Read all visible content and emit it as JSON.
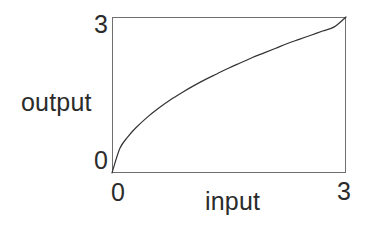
{
  "figure": {
    "name": "input-output-transfer-curve",
    "background_color": "#ffffff",
    "frame_color": "#6f6f6f",
    "curve_color": "#333333",
    "text_color": "#2b2b2b"
  },
  "chart_data": {
    "type": "line",
    "title": "",
    "xlabel": "input",
    "ylabel": "output",
    "xlim": [
      0,
      3
    ],
    "ylim": [
      0,
      3
    ],
    "xticks": [
      0,
      3
    ],
    "yticks": [
      0,
      3
    ],
    "xticklabels": [
      "0",
      "3"
    ],
    "yticklabels": [
      "0",
      "3"
    ],
    "grid": false,
    "legend": null,
    "series": [
      {
        "name": "transfer-curve",
        "description": "concave-down compressive curve from (0,0) to (3,3)",
        "color": "#333333",
        "linewidth": 1.2,
        "x": [
          0.0,
          0.1,
          0.2,
          0.3,
          0.45,
          0.6,
          0.75,
          0.9,
          1.05,
          1.2,
          1.35,
          1.5,
          1.65,
          1.8,
          1.95,
          2.1,
          2.25,
          2.4,
          2.55,
          2.7,
          2.85,
          3.0
        ],
        "y": [
          0.0,
          0.47,
          0.69,
          0.86,
          1.07,
          1.25,
          1.41,
          1.55,
          1.68,
          1.8,
          1.91,
          2.02,
          2.12,
          2.22,
          2.31,
          2.4,
          2.49,
          2.57,
          2.65,
          2.73,
          2.81,
          3.0
        ]
      }
    ]
  },
  "labels": {
    "y_top": "3",
    "y_bottom": "0",
    "x_left": "0",
    "x_right": "3",
    "y_axis_title": "output",
    "x_axis_title": "input"
  }
}
